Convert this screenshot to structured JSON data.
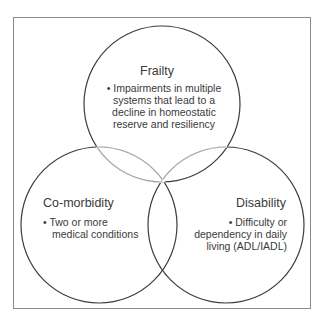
{
  "diagram": {
    "type": "venn",
    "sets": [
      {
        "id": "frailty",
        "title": "Frailty",
        "bullet": "•",
        "description_lines": [
          "Impairments in multiple",
          "systems that lead to a",
          "decline in homeostatic",
          "reserve and resiliency"
        ]
      },
      {
        "id": "comorbidity",
        "title": "Co-morbidity",
        "bullet": "•",
        "description_lines": [
          "Two or more",
          "medical conditions"
        ]
      },
      {
        "id": "disability",
        "title": "Disability",
        "bullet": "•",
        "description_lines": [
          "Difficulty or",
          "dependency in daily",
          "living (ADL/IADL)"
        ]
      }
    ],
    "colors": {
      "outer_stroke": "#3c3c3c",
      "inner_stroke": "#a0a0a0",
      "frame": "#8a8a8a",
      "text": "#3a3a3a"
    }
  }
}
